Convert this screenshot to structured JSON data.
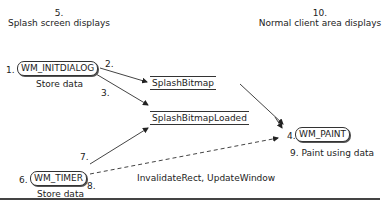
{
  "top_labels": {
    "left": {
      "number": "5.",
      "text": "Splash screen displays"
    },
    "right": {
      "number": "10.",
      "text": "Normal client area displays"
    }
  },
  "nodes": {
    "initdialog": {
      "step": "1.",
      "label": "WM_INITDIALOG",
      "sub": "Store data"
    },
    "timer": {
      "step": "6.",
      "label": "WM_TIMER",
      "sub": "Store data"
    },
    "paint": {
      "step": "4.",
      "label": "WM_PAINT",
      "sub": "9.  Paint using data"
    }
  },
  "stores": {
    "bitmap": "SplashBitmap",
    "loaded": "SplashBitmapLoaded"
  },
  "edge_labels": {
    "e2": "2.",
    "e3": "3.",
    "e7": "7.",
    "e8": "8.",
    "invalidate": "InvalidateRect, UpdateWindow"
  }
}
